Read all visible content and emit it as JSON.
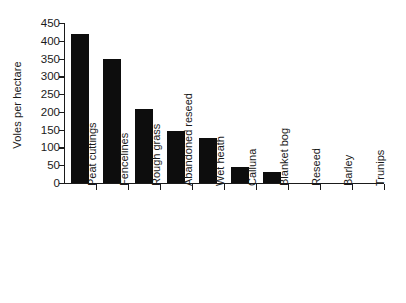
{
  "chart_data": {
    "type": "bar",
    "title": "",
    "subtitle": "",
    "xlabel": "",
    "ylabel": "Voles per hectare",
    "ylim": [
      0,
      450
    ],
    "ytick_step": 50,
    "yticks": [
      0,
      50,
      100,
      150,
      200,
      250,
      300,
      350,
      400,
      450
    ],
    "ytick_labels": [
      "0",
      "50",
      "100",
      "150",
      "200",
      "250",
      "300",
      "350",
      "400",
      "450"
    ],
    "grid": false,
    "legend": false,
    "legend_position": "none",
    "bar_color": "#0d0d0d",
    "axis_color": "#1a1a1a",
    "background_color": "#ffffff",
    "categories": [
      "Peat cuttings",
      "Fencelines",
      "Rough grass",
      "Abandoned reseed",
      "Wet heath",
      "Calluna",
      "Blanket bog",
      "Reseed",
      "Barley",
      "Trunips"
    ],
    "values": [
      420,
      348,
      207,
      147,
      127,
      45,
      32,
      0,
      0,
      0
    ]
  }
}
